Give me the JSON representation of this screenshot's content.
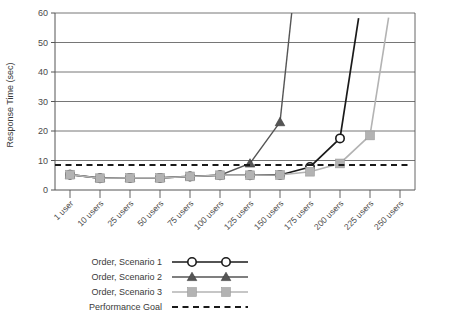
{
  "chart_data": {
    "type": "line",
    "title": "",
    "xlabel": "",
    "ylabel": "Response Time (sec)",
    "categories": [
      "1 user",
      "10 users",
      "25 users",
      "50 users",
      "75 users",
      "100 users",
      "125 users",
      "150 users",
      "175 users",
      "200 users",
      "225 users",
      "250 users"
    ],
    "ylim": [
      0,
      60
    ],
    "yticks": [
      0,
      10,
      20,
      30,
      40,
      50,
      60
    ],
    "grid": true,
    "legend_position": "bottom-left",
    "series": [
      {
        "name": "Order, Scenario 1",
        "marker": "circle-open",
        "color": "#1a1a1a",
        "values": [
          5.2,
          4.0,
          4.1,
          4.1,
          4.6,
          5.0,
          5.0,
          5.1,
          7.8,
          17.5,
          null,
          null
        ],
        "offscale_after": "200 users"
      },
      {
        "name": "Order, Scenario 2",
        "marker": "triangle-filled",
        "color": "#555555",
        "values": [
          5.2,
          4.0,
          4.1,
          4.1,
          4.6,
          5.0,
          9.0,
          23.0,
          null,
          null,
          null,
          null
        ],
        "offscale_after": "150 users"
      },
      {
        "name": "Order, Scenario 3",
        "marker": "square-filled",
        "color": "#b3b3b3",
        "values": [
          5.2,
          4.0,
          4.1,
          4.1,
          4.6,
          5.0,
          5.0,
          5.1,
          6.2,
          9.0,
          18.5,
          null
        ],
        "offscale_after": "225 users"
      },
      {
        "name": "Performance Goal",
        "marker": "none",
        "style": "dashed",
        "color": "#1a1a1a",
        "constant": 8.5
      }
    ]
  },
  "legend": {
    "items": [
      {
        "label": "Order, Scenario 1"
      },
      {
        "label": "Order, Scenario 2"
      },
      {
        "label": "Order, Scenario 3"
      },
      {
        "label": "Performance Goal"
      }
    ]
  },
  "colors": {
    "series1": "#1a1a1a",
    "series2": "#555555",
    "series3": "#b3b3b3",
    "goal": "#1a1a1a",
    "grid": "#666666",
    "axis": "#555555",
    "text": "#3a3a3a"
  }
}
